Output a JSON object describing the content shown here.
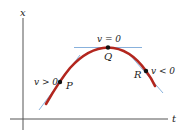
{
  "diagram": {
    "axes": {
      "vertical_label": "x",
      "horizontal_label": "t"
    },
    "points": [
      {
        "id": "P",
        "label": "P",
        "velocity_label": "v > 0"
      },
      {
        "id": "Q",
        "label": "Q",
        "velocity_label": "v = 0"
      },
      {
        "id": "R",
        "label": "R",
        "velocity_label": "v < 0"
      }
    ],
    "colors": {
      "curve": "#b3261e",
      "tangent": "#7aa8d8",
      "axis": "#555555",
      "point": "#111111",
      "text": "#222222"
    }
  }
}
